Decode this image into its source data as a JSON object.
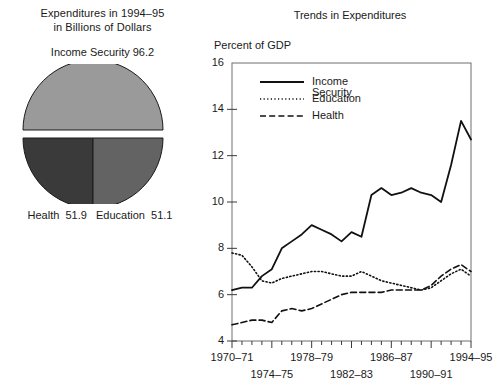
{
  "pie_panel": {
    "title_line1": "Expenditures in 1994–95",
    "title_line2": "in Billions of Dollars",
    "top_label": "Income Security  96.2",
    "bottom_label": "Health  51.9   Education  51.1",
    "slices": [
      {
        "name": "Income Security",
        "value": 96.2,
        "color": "#9a9a9a"
      },
      {
        "name": "Health",
        "value": 51.9,
        "color": "#3a3a3a"
      },
      {
        "name": "Education",
        "value": 51.1,
        "color": "#636363"
      }
    ]
  },
  "chart_panel": {
    "title": "Trends in Expenditures",
    "axis_title": "Percent of GDP",
    "legend": [
      {
        "label": "Income Security",
        "style": "solid"
      },
      {
        "label": "Education",
        "style": "dotted"
      },
      {
        "label": "Health",
        "style": "dashed"
      }
    ]
  },
  "chart_data": {
    "type": "line",
    "title": "Trends in Expenditures",
    "xlabel": "",
    "ylabel": "Percent of GDP",
    "ylim": [
      4,
      16
    ],
    "yticks": [
      4,
      6,
      8,
      10,
      12,
      14,
      16
    ],
    "grid": false,
    "legend_position": "top-left",
    "x": [
      "1970-71",
      "1971-72",
      "1972-73",
      "1973-74",
      "1974-75",
      "1975-76",
      "1976-77",
      "1977-78",
      "1978-79",
      "1979-80",
      "1980-81",
      "1981-82",
      "1982-83",
      "1983-84",
      "1984-85",
      "1985-86",
      "1986-87",
      "1987-88",
      "1988-89",
      "1989-90",
      "1990-91",
      "1991-92",
      "1992-93",
      "1993-94",
      "1994-95"
    ],
    "xtick_labels": [
      "1970–71",
      "1974–75",
      "1978–79",
      "1982–83",
      "1986–87",
      "1990–91",
      "1994–95"
    ],
    "xtick_indices": [
      0,
      4,
      8,
      12,
      16,
      20,
      24
    ],
    "series": [
      {
        "name": "Income Security",
        "style": "solid",
        "values": [
          6.2,
          6.3,
          6.3,
          6.8,
          7.1,
          8.0,
          8.3,
          8.6,
          9.0,
          8.8,
          8.6,
          8.3,
          8.7,
          8.5,
          10.3,
          10.6,
          10.3,
          10.4,
          10.6,
          10.4,
          10.3,
          10.0,
          11.6,
          13.5,
          12.7
        ]
      },
      {
        "name": "Education",
        "style": "dotted",
        "values": [
          7.8,
          7.7,
          7.2,
          6.6,
          6.5,
          6.7,
          6.8,
          6.9,
          7.0,
          7.0,
          6.9,
          6.8,
          6.8,
          7.0,
          6.8,
          6.6,
          6.5,
          6.4,
          6.3,
          6.2,
          6.3,
          6.6,
          6.9,
          7.1,
          6.8
        ]
      },
      {
        "name": "Health",
        "style": "dashed",
        "values": [
          4.7,
          4.8,
          4.9,
          4.9,
          4.8,
          5.3,
          5.4,
          5.3,
          5.4,
          5.6,
          5.8,
          6.0,
          6.1,
          6.1,
          6.1,
          6.1,
          6.2,
          6.2,
          6.2,
          6.2,
          6.4,
          6.8,
          7.1,
          7.3,
          7.0
        ]
      }
    ]
  }
}
